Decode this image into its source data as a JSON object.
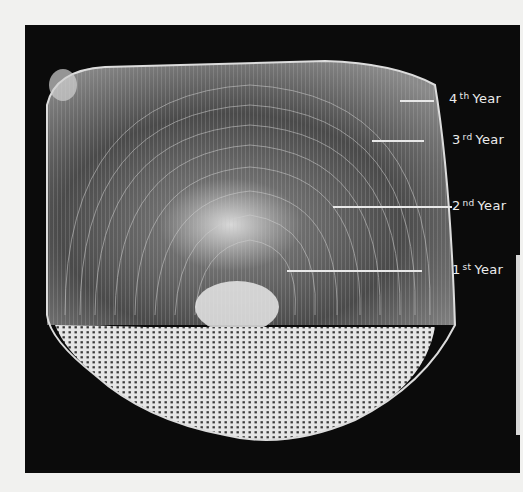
{
  "figure": {
    "background_color": "#0b0b0b",
    "page_color": "#f1f1ef"
  },
  "annuli_labels": [
    {
      "num": "4",
      "suffix": "th",
      "word": "Year"
    },
    {
      "num": "3",
      "suffix": "rd",
      "word": "Year"
    },
    {
      "num": "2",
      "suffix": "nd",
      "word": "Year"
    },
    {
      "num": "1",
      "suffix": "st",
      "word": "Year"
    }
  ]
}
